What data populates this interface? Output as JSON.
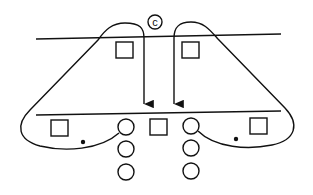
{
  "diagram": {
    "label": "c",
    "colors": {
      "stroke": "#111111",
      "background": "#ffffff"
    },
    "elements": {
      "top_line": "horizontal boundary line (upper)",
      "bottom_line": "horizontal boundary line (lower)",
      "top_squares": 2,
      "bottom_squares": 3,
      "left_circle_column": 3,
      "right_circle_column": 3,
      "dots": 2,
      "arrows": 2,
      "loops": 2
    }
  }
}
